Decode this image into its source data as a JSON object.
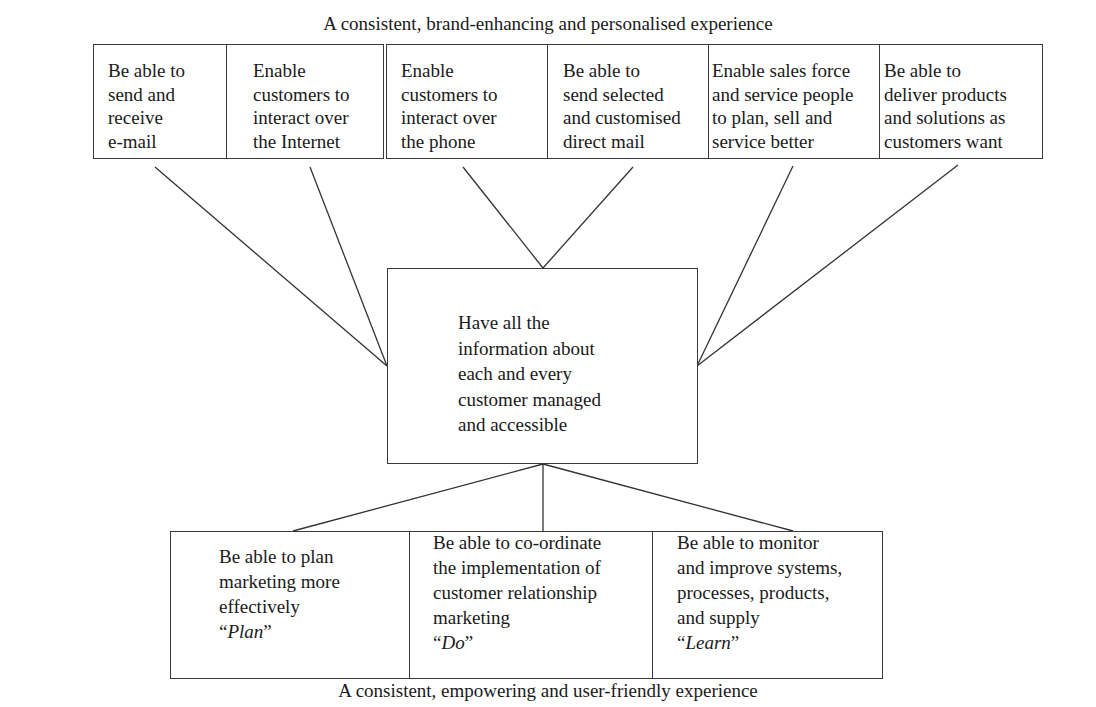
{
  "diagram": {
    "top_caption": "A consistent, brand-enhancing and personalised experience",
    "bottom_caption": "A consistent, empowering and user-friendly experience",
    "top_row": [
      {
        "id": "email",
        "text": "Be able to\nsend and\nreceive\ne-mail"
      },
      {
        "id": "internet",
        "text": "Enable\ncustomers to\ninteract over\nthe Internet"
      },
      {
        "id": "phone",
        "text": "Enable\ncustomers to\ninteract over\nthe phone"
      },
      {
        "id": "direct-mail",
        "text": "Be able to\nsend selected\nand customised\ndirect mail"
      },
      {
        "id": "sales-force",
        "text": "Enable sales force\nand service people\nto plan, sell and\nservice better"
      },
      {
        "id": "deliver",
        "text": "Be able to\ndeliver products\nand solutions as\ncustomers want"
      }
    ],
    "center": {
      "text": "Have all the\ninformation about\neach and every\ncustomer managed\nand accessible"
    },
    "bottom_row": [
      {
        "id": "plan",
        "text": "Be able to plan\nmarketing more\neffectively",
        "tag_open": "“",
        "tag": "Plan",
        "tag_close": "”"
      },
      {
        "id": "do",
        "text": "Be able to co-ordinate\nthe implementation of\ncustomer relationship\nmarketing",
        "tag_open": "“",
        "tag": "Do",
        "tag_close": "”"
      },
      {
        "id": "learn",
        "text": "Be able to monitor\nand improve systems,\nprocesses, products,\nand supply",
        "tag_open": "“",
        "tag": "Learn",
        "tag_close": "”"
      }
    ],
    "colors": {
      "line": "#333333",
      "text": "#1a1a1a",
      "background": "#ffffff"
    }
  }
}
